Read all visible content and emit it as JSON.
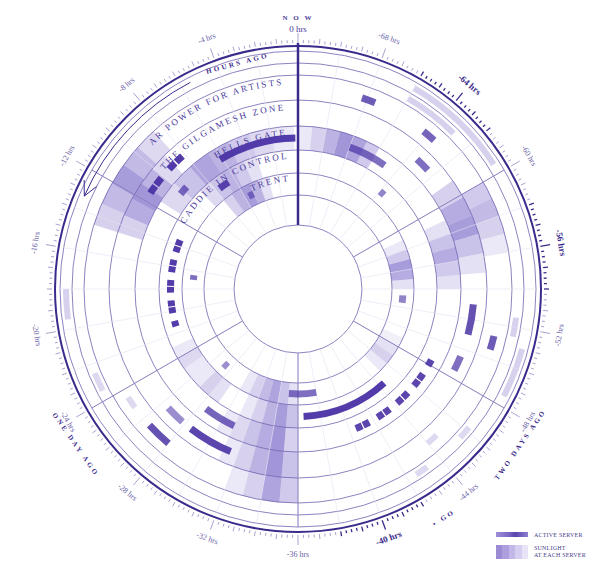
{
  "chart_data": {
    "type": "radial-timeline",
    "title": "",
    "center_top_label": {
      "line1": "N O W",
      "line2": "0 hrs"
    },
    "direction": "counter-clockwise from top, 72 hours per full revolution",
    "tick_labels": [
      {
        "hours": 0,
        "label": "0 hrs"
      },
      {
        "hours": -4,
        "label": "-4 hrs"
      },
      {
        "hours": -8,
        "label": "-8 hrs"
      },
      {
        "hours": -12,
        "label": "-12 hrs"
      },
      {
        "hours": -16,
        "label": "-16 hrs"
      },
      {
        "hours": -20,
        "label": "-20 hrs"
      },
      {
        "hours": -24,
        "label": "-24 hrs"
      },
      {
        "hours": -28,
        "label": "-28 hrs"
      },
      {
        "hours": -32,
        "label": "-32 hrs"
      },
      {
        "hours": -36,
        "label": "-36 hrs"
      },
      {
        "hours": -40,
        "label": "-40 hrs"
      },
      {
        "hours": -44,
        "label": "-44 hrs"
      },
      {
        "hours": -48,
        "label": "-48 hrs"
      },
      {
        "hours": -52,
        "label": "-52 hrs"
      },
      {
        "hours": -56,
        "label": "-56 hrs"
      },
      {
        "hours": -60,
        "label": "-60 hrs"
      },
      {
        "hours": -64,
        "label": "-64 hrs"
      },
      {
        "hours": -68,
        "label": "-68 hrs"
      }
    ],
    "highlighted_ticks": [
      -40,
      -56,
      -64
    ],
    "arc_annotations": [
      {
        "text": "HOURS AGO",
        "at_hours": -3
      },
      {
        "text": "ONE DAY AGO",
        "at_hours": -25
      },
      {
        "text": "TWO DAYS AGO",
        "at_hours": -47
      },
      {
        "text": "• GO",
        "at_hours": -42.5
      }
    ],
    "rings": [
      {
        "name": "AR POWER FOR ARTISTS",
        "r_in": 189,
        "r_out": 214
      },
      {
        "name": "THE GILGAMESH ZONE",
        "r_in": 163,
        "r_out": 189
      },
      {
        "name": "HELLS GATE",
        "r_in": 139,
        "r_out": 163
      },
      {
        "name": "CADDIE IN CONTROL",
        "r_in": 116,
        "r_out": 139
      },
      {
        "name": "TRENT",
        "r_in": 94,
        "r_out": 116
      }
    ],
    "sunlight": [
      {
        "ring": 0,
        "start": -8.5,
        "end": -14.5,
        "levels": [
          0.25,
          0.45,
          0.65,
          0.45,
          0.3
        ]
      },
      {
        "ring": 1,
        "start": -9,
        "end": -14.5,
        "levels": [
          0.25,
          0.5,
          0.7,
          0.55,
          0.3
        ]
      },
      {
        "ring": 2,
        "start": -0.3,
        "end": -11.5,
        "levels": [
          0.15,
          0.25,
          0.35,
          0.5,
          0.6,
          0.4,
          0.25
        ]
      },
      {
        "ring": 3,
        "start": -3.5,
        "end": -9,
        "levels": [
          0.2,
          0.35,
          0.5,
          0.4,
          0.25
        ]
      },
      {
        "ring": 4,
        "start": -3,
        "end": -8,
        "levels": [
          0.2,
          0.5,
          0.65,
          0.5,
          0.3
        ]
      },
      {
        "ring": 2,
        "start": -66,
        "end": -72,
        "levels": [
          0.35,
          0.6,
          0.7,
          0.5,
          0.3,
          0.15
        ]
      },
      {
        "ring": 0,
        "start": -56,
        "end": -60,
        "levels": [
          0.15,
          0.3,
          0.45,
          0.35
        ]
      },
      {
        "ring": 1,
        "start": -55,
        "end": -61,
        "levels": [
          0.2,
          0.4,
          0.65,
          0.55,
          0.3
        ]
      },
      {
        "ring": 2,
        "start": -54,
        "end": -59,
        "levels": [
          0.2,
          0.35,
          0.55,
          0.4,
          0.2
        ]
      },
      {
        "ring": 4,
        "start": -54,
        "end": -59,
        "levels": [
          0.2,
          0.55,
          0.65,
          0.35,
          0.15
        ]
      },
      {
        "ring": 0,
        "start": -32,
        "end": -36,
        "levels": [
          0.15,
          0.3,
          0.6,
          0.35
        ]
      },
      {
        "ring": 1,
        "start": -31,
        "end": -36,
        "levels": [
          0.15,
          0.3,
          0.5,
          0.7,
          0.4
        ]
      },
      {
        "ring": 2,
        "start": -30,
        "end": -36,
        "levels": [
          0.15,
          0.25,
          0.4,
          0.55,
          0.7,
          0.3
        ]
      },
      {
        "ring": 3,
        "start": -26,
        "end": -29,
        "levels": [
          0.15,
          0.3,
          0.2
        ]
      },
      {
        "ring": 3,
        "start": -31,
        "end": -36,
        "levels": [
          0.15,
          0.3,
          0.5,
          0.65,
          0.4
        ]
      },
      {
        "ring": 4,
        "start": -30,
        "end": -36,
        "levels": [
          0.15,
          0.3,
          0.45,
          0.6,
          0.4,
          0.2
        ]
      },
      {
        "ring": 4,
        "start": -45,
        "end": -49,
        "levels": [
          0.15,
          0.3,
          0.2,
          0.1
        ]
      },
      {
        "ring": 3,
        "start": -23,
        "end": -26,
        "levels": [
          0.15,
          0.25,
          0.15
        ]
      }
    ],
    "active_server": [
      {
        "ring": 2,
        "start": -0.2,
        "end": -6.2,
        "shade": 0.95
      },
      {
        "ring": 3,
        "start": -6.6,
        "end": -7.6,
        "shade": 0.9
      },
      {
        "ring": 2,
        "start": -9.5,
        "end": -10.2,
        "shade": 0.7
      },
      {
        "ring": 1,
        "start": -8.2,
        "end": -11.5,
        "shade": 0.95,
        "dashed": true
      },
      {
        "ring": 4,
        "start": -5,
        "end": -5.6,
        "shade": 0.6
      },
      {
        "ring": 3,
        "start": -13.5,
        "end": -21.5,
        "shade": 0.95,
        "dashed": true
      },
      {
        "ring": 4,
        "start": -16.5,
        "end": -17,
        "shade": 0.7
      },
      {
        "ring": 2,
        "start": -65,
        "end": -68,
        "shade": 0.7
      },
      {
        "ring": 3,
        "start": -63.5,
        "end": -64,
        "shade": 0.6
      },
      {
        "ring": 0,
        "start": -67.5,
        "end": -68.3,
        "shade": 0.8
      },
      {
        "ring": 0,
        "start": -63.5,
        "end": -64.3,
        "shade": 0.75
      },
      {
        "ring": 1,
        "start": -62.5,
        "end": -63.5,
        "shade": 0.7
      },
      {
        "ring": 4,
        "start": -52.5,
        "end": -53.3,
        "shade": 0.6
      },
      {
        "ring": 1,
        "start": -51,
        "end": -53,
        "shade": 0.85
      },
      {
        "ring": 0,
        "start": -50.5,
        "end": -51.3,
        "shade": 0.8
      },
      {
        "ring": 1,
        "start": -48.5,
        "end": -49.5,
        "shade": 0.7
      },
      {
        "ring": 2,
        "start": -40.5,
        "end": -48.5,
        "shade": 0.9,
        "dashed": true
      },
      {
        "ring": 3,
        "start": -36.5,
        "end": -44.5,
        "shade": 0.95
      },
      {
        "ring": 2,
        "start": -28.5,
        "end": -31,
        "shade": 0.75
      },
      {
        "ring": 0,
        "start": -26.5,
        "end": -28,
        "shade": 0.85
      },
      {
        "ring": 1,
        "start": -26.5,
        "end": -27.8,
        "shade": 0.55
      },
      {
        "ring": 1,
        "start": -28.5,
        "end": -31.5,
        "shade": 0.9
      },
      {
        "ring": 4,
        "start": -27,
        "end": -27.6,
        "shade": 0.55
      },
      {
        "ring": 4,
        "start": -35,
        "end": -38,
        "shade": 0.7
      }
    ],
    "faint_marks": [
      {
        "ring": -1,
        "start": -63,
        "end": -66,
        "shade": 0.3
      },
      {
        "ring": -2,
        "start": -60.5,
        "end": -66,
        "shade": 0.3
      },
      {
        "ring": -1,
        "start": -51.5,
        "end": -52.5,
        "shade": 0.3
      },
      {
        "ring": -2,
        "start": -48.5,
        "end": -51,
        "shade": 0.3
      },
      {
        "ring": -1,
        "start": -45.5,
        "end": -46.2,
        "shade": 0.25
      },
      {
        "ring": 0,
        "start": -44,
        "end": -44.7,
        "shade": 0.25
      },
      {
        "ring": -1,
        "start": -42.5,
        "end": -43.2,
        "shade": 0.25
      },
      {
        "ring": -2,
        "start": -18,
        "end": -19.5,
        "shade": 0.3
      },
      {
        "ring": -1,
        "start": -22.5,
        "end": -23.5,
        "shade": 0.25
      },
      {
        "ring": 0,
        "start": -24.5,
        "end": -25.2,
        "shade": 0.25
      }
    ]
  },
  "legend": {
    "items": [
      {
        "key": "active",
        "label": "ACTIVE SERVER"
      },
      {
        "key": "sun",
        "label_line1": "SUNLIGHT",
        "label_line2": "AT EACH SERVER"
      }
    ]
  },
  "colors": {
    "ink": "#4a3a9c",
    "ink_dark": "#3a2a8c",
    "grid": "#6e63b0",
    "grid_light": "#e4e0f2",
    "fill_base": [
      122,
      104,
      200
    ]
  }
}
